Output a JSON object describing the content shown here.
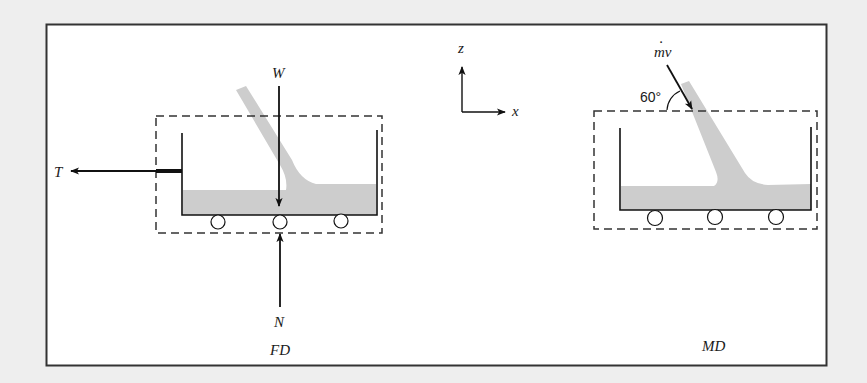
{
  "figure": {
    "background_color": "#eeeeee",
    "frame_color": "#333333",
    "liquid_color": "#cccccc",
    "ink_color": "#111111"
  },
  "fd_panel": {
    "caption": "FD",
    "forces": {
      "weight": "W",
      "normal": "N",
      "tension": "T"
    }
  },
  "axes": {
    "vertical": "z",
    "horizontal": "x"
  },
  "md_panel": {
    "caption": "MD",
    "momentum_label_base": "mv",
    "momentum_label_dot": "·",
    "angle_label": "60°"
  }
}
